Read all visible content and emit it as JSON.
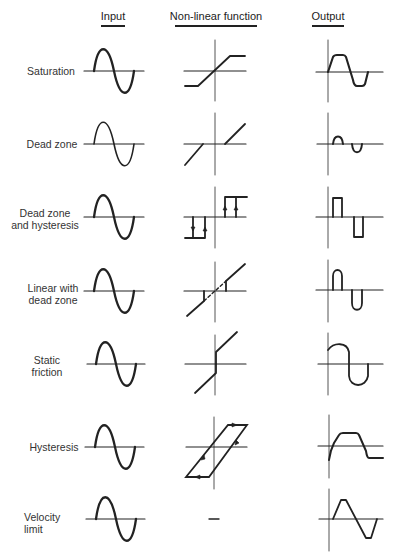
{
  "headers": {
    "input": "Input",
    "nonlinear": "Non-linear function",
    "output": "Output"
  },
  "rows": [
    {
      "id": "saturation",
      "label_lines": [
        "Saturation"
      ],
      "axis_y": 71,
      "nonlinear_type": "saturation",
      "output_type": "clipped-sine"
    },
    {
      "id": "dead-zone",
      "label_lines": [
        "Dead zone"
      ],
      "axis_y": 144,
      "nonlinear_type": "dead-zone",
      "output_type": "reduced-lobes"
    },
    {
      "id": "dead-zone-hysteresis",
      "label_lines": [
        "Dead zone",
        "and hysteresis"
      ],
      "axis_y": 217,
      "nonlinear_type": "dead-zone-hysteresis-relay",
      "output_type": "rectangular-pulses"
    },
    {
      "id": "linear-dead-zone",
      "label_lines": [
        "Linear with",
        "dead zone"
      ],
      "axis_y": 291,
      "nonlinear_type": "linear-with-dead-zone",
      "output_type": "rounded-pulses"
    },
    {
      "id": "static-friction",
      "label_lines": [
        "Static",
        "friction"
      ],
      "axis_y": 364,
      "nonlinear_type": "static-friction",
      "output_type": "offset-sine"
    },
    {
      "id": "hysteresis",
      "label_lines": [
        "Hysteresis"
      ],
      "axis_y": 447,
      "nonlinear_type": "hysteresis-loop",
      "output_type": "lagged-clipped"
    },
    {
      "id": "velocity-limit",
      "label_lines": [
        "Velocity",
        "limit"
      ],
      "axis_y": 519,
      "nonlinear_type": "none-dash",
      "output_type": "triangular"
    }
  ],
  "colors": {
    "ink": "#222222",
    "axis": "#555555",
    "background": "#ffffff"
  }
}
